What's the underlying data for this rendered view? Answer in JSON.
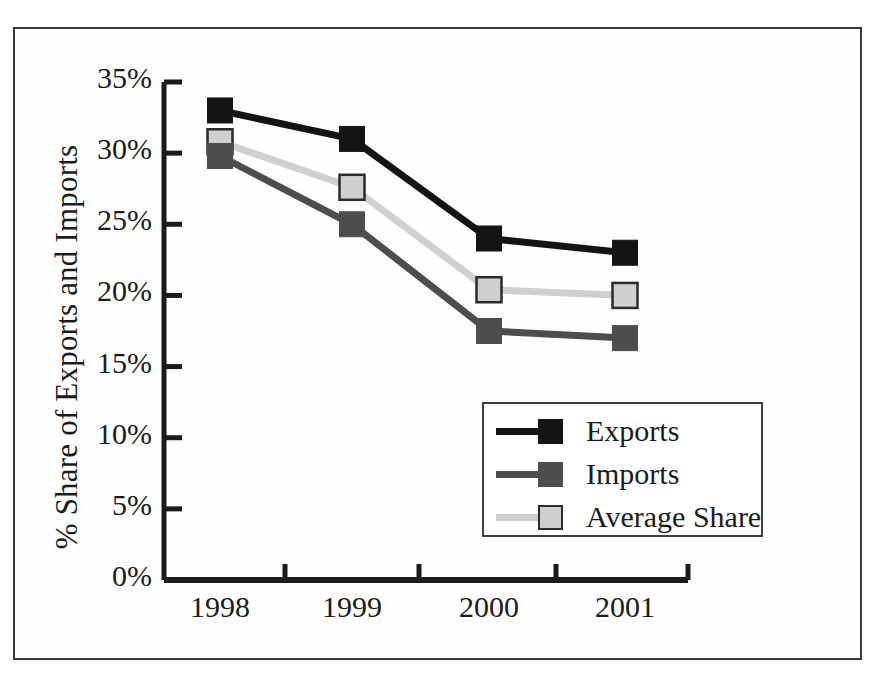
{
  "chart_data": {
    "type": "line",
    "title": "",
    "xlabel": "",
    "ylabel": "% Share of Exports and Imports",
    "categories": [
      "1998",
      "1999",
      "2000",
      "2001"
    ],
    "ylim": [
      0,
      35
    ],
    "ytick_labels": [
      "0%",
      "5%",
      "10%",
      "15%",
      "20%",
      "25%",
      "30%",
      "35%"
    ],
    "ytick_values": [
      0,
      5,
      10,
      15,
      20,
      25,
      30,
      35
    ],
    "grid": false,
    "legend_position": "center-right",
    "series": [
      {
        "name": "Exports",
        "color": "#141414",
        "marker": "square",
        "values": [
          33.0,
          31.0,
          24.0,
          23.0
        ]
      },
      {
        "name": "Imports",
        "color": "#4d4d4d",
        "marker": "square",
        "values": [
          29.8,
          25.0,
          17.5,
          17.0
        ]
      },
      {
        "name": "Average Share",
        "color": "#cfcfcf",
        "marker": "square",
        "values": [
          30.8,
          27.6,
          20.4,
          20.0
        ]
      }
    ]
  },
  "colors": {
    "exports": "#141414",
    "imports": "#4d4d4d",
    "average_share": "#cfcfcf",
    "marker_border": "#2b2b2b",
    "axis": "#1b1b1b",
    "frame": "#3a3a3a",
    "background": "#ffffff"
  }
}
